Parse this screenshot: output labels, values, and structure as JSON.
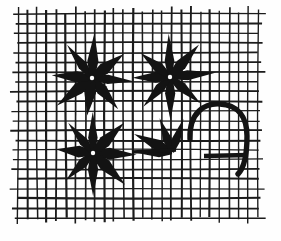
{
  "figure": {
    "width": 281,
    "height": 241,
    "background_color": "#fefefe",
    "ink_color": "#131313"
  },
  "grid": {
    "name": "square-grid",
    "origin_x": 18,
    "origin_y": 14,
    "columns": 26,
    "rows": 22,
    "cell_width": 9.6,
    "cell_height": 9.7,
    "line_color": "#1b1b1b",
    "line_width": 1.7,
    "overshoot": 6,
    "label": "grid"
  },
  "shapes": [
    {
      "name": "asterisk-top-left",
      "type": "asterisk",
      "rays": 8,
      "center_x": 92,
      "center_y": 78,
      "radius": 43,
      "ray_half_width": 5.2,
      "rotation": 6,
      "complete": true,
      "label": "Eight-ray asterisk (upper left)"
    },
    {
      "name": "asterisk-top-right",
      "type": "asterisk",
      "rays": 8,
      "center_x": 170,
      "center_y": 77,
      "radius": 43,
      "ray_half_width": 5.0,
      "rotation": -4,
      "complete": true,
      "label": "Eight-ray asterisk (upper right)"
    },
    {
      "name": "asterisk-bottom-left",
      "type": "asterisk",
      "rays": 8,
      "center_x": 93,
      "center_y": 153,
      "radius": 42,
      "ray_half_width": 5.2,
      "rotation": 3,
      "complete": true,
      "label": "Eight-ray asterisk (lower left)"
    },
    {
      "name": "asterisk-partial-bottom-right",
      "type": "partial-asterisk",
      "rays": 4,
      "center_x": 172,
      "center_y": 152,
      "radius": 40,
      "ray_half_width": 5.0,
      "ray_angles": [
        181,
        206,
        249,
        292
      ],
      "complete": false,
      "label": "Partial asterisk (lower right, upper rays only)"
    },
    {
      "name": "horizontal-bar-left",
      "type": "bar",
      "x1": 132,
      "y1": 152,
      "x2": 176,
      "y2": 150,
      "thickness": 3.4,
      "label": "Horizontal stroke left of partial asterisk"
    },
    {
      "name": "hook-arc",
      "type": "arc",
      "path": "M 190 139 C 189 112 205 103 220 104 C 238 105 247 117 247 136 C 247 154 244 168 238 174",
      "stroke_width": 5.4,
      "label": "Curved hook / inverted-U arc"
    },
    {
      "name": "hook-crossbar",
      "type": "bar",
      "x1": 204,
      "y1": 156,
      "x2": 248,
      "y2": 155,
      "thickness": 4.6,
      "label": "Horizontal bar crossing the hook"
    }
  ],
  "counts": {
    "complete_asterisks": 3,
    "partial_asterisks": 1,
    "hooks": 1,
    "total_figures": 5
  }
}
